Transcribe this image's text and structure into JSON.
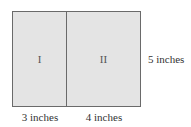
{
  "diagram": {
    "regions": [
      {
        "label": "I",
        "width_label": "3 inches"
      },
      {
        "label": "II",
        "width_label": "4 inches"
      }
    ],
    "height_label": "5 inches",
    "colors": {
      "fill": "#e4e4e4",
      "stroke": "#6a6a6a"
    }
  }
}
